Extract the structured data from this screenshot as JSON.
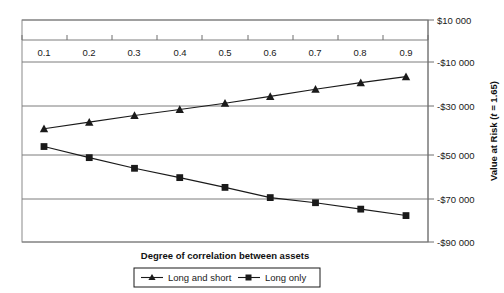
{
  "chart_data": {
    "type": "line",
    "title": "",
    "xlabel": "Degree of correlation between assets",
    "ylabel": "Value at Risk (t = 1.65)",
    "ylabel_parts": {
      "prefix": "Value at Risk (",
      "italic": "t",
      "suffix": " = 1.65)"
    },
    "x": [
      0.1,
      0.2,
      0.3,
      0.4,
      0.5,
      0.6,
      0.7,
      0.8,
      0.9
    ],
    "xticklabels": [
      "0.1",
      "0.2",
      "0.3",
      "0.4",
      "0.5",
      "0.6",
      "0.7",
      "0.8",
      "0.9"
    ],
    "yticks": [
      10000,
      -10000,
      -30000,
      -50000,
      -70000,
      -90000
    ],
    "yticklabels": [
      "$10 000",
      "-$10 000",
      "-$30 000",
      "-$50 000",
      "-$70 000",
      "-$90 000"
    ],
    "ylim": [
      -90000,
      10000
    ],
    "xlim": [
      0.05,
      0.95
    ],
    "grid": true,
    "grid_axis": "y",
    "legend_position": "bottom-center",
    "series": [
      {
        "name": "Long and short",
        "marker": "triangle",
        "color": "#1a1a1a",
        "values": [
          -39000,
          -36000,
          -33000,
          -30300,
          -27500,
          -24400,
          -21200,
          -18200,
          -15500
        ]
      },
      {
        "name": "Long only",
        "marker": "square",
        "color": "#1a1a1a",
        "values": [
          -47000,
          -52000,
          -56800,
          -61000,
          -65400,
          -70000,
          -72300,
          -75200,
          -78100
        ]
      }
    ]
  },
  "axis": {
    "x_title": "Degree of correlation between assets",
    "y_title_prefix": "Value at Risk (",
    "y_title_italic": "t",
    "y_title_suffix": " = 1.65)"
  },
  "legend": {
    "items": [
      {
        "label": "Long and short",
        "marker": "triangle-icon"
      },
      {
        "label": "Long only",
        "marker": "square-icon"
      }
    ]
  },
  "ticks": {
    "x": [
      "0.1",
      "0.2",
      "0.3",
      "0.4",
      "0.5",
      "0.6",
      "0.7",
      "0.8",
      "0.9"
    ],
    "y": [
      "$10 000",
      "-$10 000",
      "-$30 000",
      "-$50 000",
      "-$70 000",
      "-$90 000"
    ]
  },
  "colors": {
    "line": "#1a1a1a",
    "grid": "#7d7d7d",
    "frame": "#8a8a8a",
    "background": "#ffffff"
  }
}
